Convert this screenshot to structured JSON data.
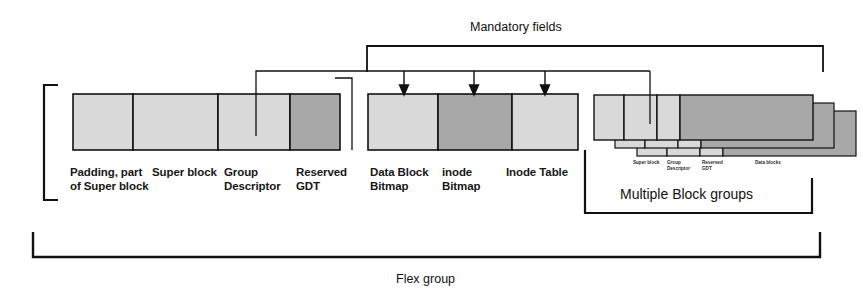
{
  "diagram": {
    "colors": {
      "block_light": "#d9d9d9",
      "block_dark": "#a8a8a8",
      "line": "#111111",
      "background": "#ffffff"
    },
    "captions": {
      "mandatory_fields": "Mandatory fields",
      "multiple_block_groups": "Multiple Block groups",
      "flex_group": "Flex group"
    },
    "group1": {
      "name": "first-block-group",
      "blocks": [
        {
          "label": "Padding, part\nof Super block",
          "shade": "light"
        },
        {
          "label": "Super block",
          "shade": "light"
        },
        {
          "label": "Group\nDescriptor",
          "shade": "light"
        },
        {
          "label": "Reserved\nGDT",
          "shade": "dark"
        }
      ]
    },
    "group2": {
      "name": "mandatory-fields-block-group",
      "blocks": [
        {
          "label": "Data Block\nBitmap",
          "shade": "light"
        },
        {
          "label": "inode\nBitmap",
          "shade": "dark"
        },
        {
          "label": "Inode Table",
          "shade": "light"
        }
      ]
    },
    "group3": {
      "name": "multiple-block-groups",
      "stack_count": 3,
      "blocks": [
        {
          "label": "Super block",
          "shade": "light"
        },
        {
          "label": "Group\nDescriptor",
          "shade": "light"
        },
        {
          "label": "Reserved\nGDT",
          "shade": "light"
        },
        {
          "label": "Data blocks",
          "shade": "dark"
        }
      ]
    },
    "connectors": {
      "arrow_targets": [
        "Data Block Bitmap",
        "inode Bitmap",
        "Inode Table"
      ],
      "arrow_count": 3,
      "source_fields": [
        "Group Descriptor",
        "Reserved GDT"
      ]
    }
  }
}
